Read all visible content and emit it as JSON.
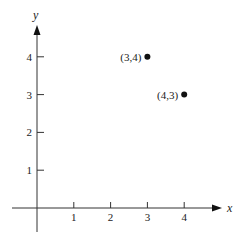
{
  "chart_data": {
    "type": "scatter",
    "title": "",
    "xlabel": "x",
    "ylabel": "y",
    "xlim": [
      -0.8,
      5.1
    ],
    "ylim": [
      -0.7,
      4.8
    ],
    "x_ticks": [
      1,
      2,
      3,
      4
    ],
    "y_ticks": [
      1,
      2,
      3,
      4
    ],
    "x_tick_labels": [
      "1",
      "2",
      "3",
      "4"
    ],
    "y_tick_labels": [
      "1",
      "2",
      "3",
      "4"
    ],
    "grid": false,
    "legend": null,
    "points": [
      {
        "x": 3,
        "y": 4,
        "label": "(3,4)"
      },
      {
        "x": 4,
        "y": 3,
        "label": "(4,3)"
      }
    ]
  }
}
